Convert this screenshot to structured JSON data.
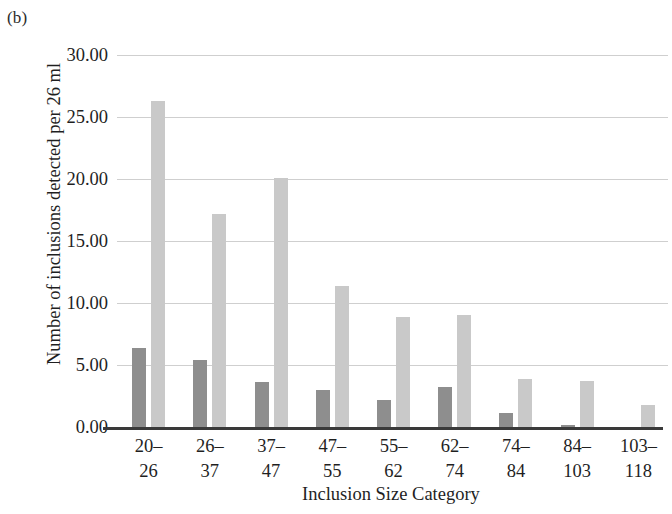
{
  "figure": {
    "panel_label": "(b)",
    "ylabel": "Number of inclusions detected per 26 ml",
    "xlabel": "Inclusion Size Category"
  },
  "colors": {
    "series_dark": "#8e8e8e",
    "series_light": "#c9c9c9",
    "gridline": "#cfcfcf",
    "axis": "#3a3a3a",
    "background": "#ffffff",
    "text": "#1f1f1f"
  },
  "chart_data": {
    "type": "bar",
    "title": "(b)",
    "xlabel": "Inclusion Size Category",
    "ylabel": "Number of inclusions detected per 26 ml",
    "categories": [
      "20–26",
      "26–37",
      "37–47",
      "47–55",
      "55–62",
      "62–74",
      "74–84",
      "84–103",
      "103–118"
    ],
    "category_lines": [
      [
        "20–",
        "26"
      ],
      [
        "26–",
        "37"
      ],
      [
        "37–",
        "47"
      ],
      [
        "47–",
        "55"
      ],
      [
        "55–",
        "62"
      ],
      [
        "62–",
        "74"
      ],
      [
        "74–",
        "84"
      ],
      [
        "84–",
        "103"
      ],
      [
        "103–",
        "118"
      ]
    ],
    "series": [
      {
        "name": "dark",
        "color": "#8e8e8e",
        "values": [
          6.4,
          5.4,
          3.6,
          3.0,
          2.2,
          3.2,
          1.1,
          0.2,
          0.0
        ]
      },
      {
        "name": "light",
        "color": "#c9c9c9",
        "values": [
          26.3,
          17.2,
          20.1,
          11.4,
          8.9,
          9.0,
          3.9,
          3.7,
          1.8
        ]
      }
    ],
    "ylim": [
      0,
      30
    ],
    "ytick_values": [
      0,
      5,
      10,
      15,
      20,
      25,
      30
    ],
    "ytick_labels": [
      "0.00",
      "5.00",
      "10.00",
      "15.00",
      "20.00",
      "25.00",
      "30.00"
    ],
    "grid": true,
    "grid_axis": "y",
    "legend": "none"
  }
}
